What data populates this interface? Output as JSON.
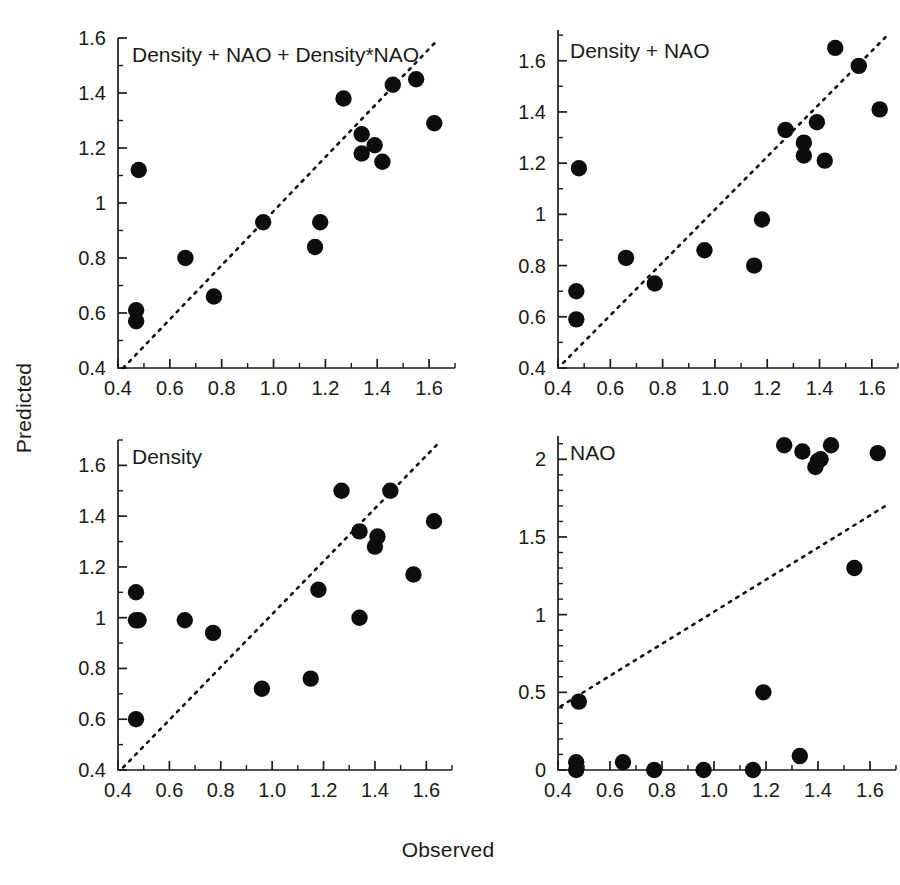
{
  "figure": {
    "xlabel": "Observed",
    "ylabel": "Predicted",
    "point_color": "#0d0d0d",
    "line_color": "#111111",
    "background": "#ffffff"
  },
  "chart_data": [
    {
      "type": "scatter",
      "title": "Density + NAO + Density*NAO",
      "xlabel": "Observed",
      "ylabel": "Predicted",
      "xlim": [
        0.4,
        1.7
      ],
      "ylim": [
        0.4,
        1.6
      ],
      "xticks": [
        "0.4",
        "0.6",
        "0.8",
        "1.0",
        "1.2",
        "1.4",
        "1.6"
      ],
      "xtick_values": [
        0.4,
        0.6,
        0.8,
        1.0,
        1.2,
        1.4,
        1.6
      ],
      "yticks": [
        "0.4",
        "0.6",
        "0.8",
        "1",
        "1.2",
        "1.4",
        "1.6"
      ],
      "ytick_values": [
        0.4,
        0.6,
        0.8,
        1.0,
        1.2,
        1.4,
        1.6
      ],
      "minor_tick_step_x": 0.1,
      "minor_tick_step_y": 0.1,
      "grid": false,
      "legend": "none",
      "annotations": [
        "1:1 reference line (dotted)"
      ],
      "reference_line": {
        "style": "dotted",
        "from": [
          0.42,
          0.4
        ],
        "to": [
          1.62,
          1.58
        ]
      },
      "x": [
        0.47,
        0.47,
        0.48,
        0.66,
        0.77,
        0.96,
        1.16,
        1.18,
        1.27,
        1.34,
        1.34,
        1.39,
        1.42,
        1.46,
        1.55,
        1.62
      ],
      "y": [
        0.61,
        0.57,
        1.12,
        0.8,
        0.66,
        0.93,
        0.84,
        0.93,
        1.38,
        1.25,
        1.18,
        1.21,
        1.15,
        1.43,
        1.45,
        1.29
      ]
    },
    {
      "type": "scatter",
      "title": "Density + NAO",
      "xlabel": "Observed",
      "ylabel": "Predicted",
      "xlim": [
        0.4,
        1.7
      ],
      "ylim": [
        0.4,
        1.72
      ],
      "xticks": [
        "0.4",
        "0.6",
        "0.8",
        "1.0",
        "1.2",
        "1.4",
        "1.6"
      ],
      "xtick_values": [
        0.4,
        0.6,
        0.8,
        1.0,
        1.2,
        1.4,
        1.6
      ],
      "yticks": [
        "0.4",
        "0.6",
        "0.8",
        "1",
        "1.2",
        "1.4",
        "1.6"
      ],
      "ytick_values": [
        0.4,
        0.6,
        0.8,
        1.0,
        1.2,
        1.4,
        1.6
      ],
      "minor_tick_step_x": 0.1,
      "minor_tick_step_y": 0.1,
      "grid": false,
      "legend": "none",
      "annotations": [
        "1:1 reference line (dotted)"
      ],
      "reference_line": {
        "style": "dotted",
        "from": [
          0.42,
          0.42
        ],
        "to": [
          1.66,
          1.7
        ]
      },
      "x": [
        0.47,
        0.47,
        0.48,
        0.66,
        0.77,
        0.96,
        1.15,
        1.18,
        1.27,
        1.34,
        1.34,
        1.39,
        1.42,
        1.46,
        1.55,
        1.63
      ],
      "y": [
        0.7,
        0.59,
        1.18,
        0.83,
        0.73,
        0.86,
        0.8,
        0.98,
        1.33,
        1.28,
        1.23,
        1.36,
        1.21,
        1.65,
        1.58,
        1.41
      ]
    },
    {
      "type": "scatter",
      "title": "Density",
      "xlabel": "Observed",
      "ylabel": "Predicted",
      "xlim": [
        0.4,
        1.7
      ],
      "ylim": [
        0.4,
        1.7
      ],
      "xticks": [
        "0.4",
        "0.6",
        "0.8",
        "1.0",
        "1.2",
        "1.4",
        "1.6"
      ],
      "xtick_values": [
        0.4,
        0.6,
        0.8,
        1.0,
        1.2,
        1.4,
        1.6
      ],
      "yticks": [
        "0.4",
        "0.6",
        "0.8",
        "1",
        "1.2",
        "1.4",
        "1.6"
      ],
      "ytick_values": [
        0.4,
        0.6,
        0.8,
        1.0,
        1.2,
        1.4,
        1.6
      ],
      "minor_tick_step_x": 0.1,
      "minor_tick_step_y": 0.1,
      "grid": false,
      "legend": "none",
      "annotations": [
        "1:1 reference line (dotted)"
      ],
      "reference_line": {
        "style": "dotted",
        "from": [
          0.42,
          0.41
        ],
        "to": [
          1.64,
          1.68
        ]
      },
      "x": [
        0.47,
        0.47,
        0.47,
        0.48,
        0.66,
        0.77,
        0.96,
        1.15,
        1.18,
        1.27,
        1.34,
        1.34,
        1.4,
        1.41,
        1.46,
        1.55,
        1.63
      ],
      "y": [
        0.99,
        0.6,
        1.1,
        0.99,
        0.99,
        0.94,
        0.72,
        0.76,
        1.11,
        1.5,
        1.34,
        1.0,
        1.28,
        1.32,
        1.5,
        1.17,
        1.38
      ]
    },
    {
      "type": "scatter",
      "title": "NAO",
      "xlabel": "Observed",
      "ylabel": "Predicted",
      "xlim": [
        0.4,
        1.7
      ],
      "ylim": [
        0.0,
        2.15
      ],
      "xticks": [
        "0.4",
        "0.6",
        "0.8",
        "1.0",
        "1.2",
        "1.4",
        "1.6"
      ],
      "xtick_values": [
        0.4,
        0.6,
        0.8,
        1.0,
        1.2,
        1.4,
        1.6
      ],
      "yticks": [
        "0",
        "0.5",
        "1",
        "1.5",
        "2"
      ],
      "ytick_values": [
        0.0,
        0.5,
        1.0,
        1.5,
        2.0
      ],
      "minor_tick_step_x": 0.1,
      "minor_tick_step_y": 0.1,
      "grid": false,
      "legend": "none",
      "annotations": [
        "1:1 reference line (dotted)"
      ],
      "reference_line": {
        "style": "dotted",
        "from": [
          0.41,
          0.41
        ],
        "to": [
          1.66,
          1.7
        ]
      },
      "x": [
        0.47,
        0.47,
        0.48,
        0.65,
        0.77,
        0.96,
        1.15,
        1.19,
        1.27,
        1.33,
        1.34,
        1.39,
        1.4,
        1.41,
        1.45,
        1.54,
        1.63
      ],
      "y": [
        0.05,
        0.0,
        0.44,
        0.05,
        0.0,
        0.0,
        0.0,
        0.5,
        2.09,
        0.09,
        2.05,
        1.95,
        1.99,
        2.0,
        2.09,
        1.3,
        2.04
      ]
    }
  ]
}
